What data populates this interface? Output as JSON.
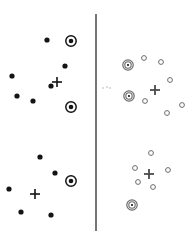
{
  "figure": {
    "title": "",
    "background_color": "#ffffff",
    "width": 192,
    "height": 238,
    "divider": {
      "name": "vertical-divider",
      "x": 96,
      "y_top": 14,
      "y_bottom": 231,
      "color": "#3c3c3c"
    }
  },
  "legend": {
    "filled_dot_label": "",
    "open_circle_label": "",
    "bullseye_label": "",
    "cross_label": ""
  },
  "chart_data": {
    "type": "scatter",
    "title": "",
    "subtitle": "",
    "xlabel": "",
    "ylabel": "",
    "xlim": [
      0,
      192
    ],
    "ylim": [
      0,
      238
    ],
    "grid": false,
    "legend_position": "none",
    "axis_visible": false,
    "colors": {
      "filled": "#141414",
      "open": "#6b6b6b",
      "cross_dark": "#141414",
      "cross_light": "#4a4a4a",
      "divider": "#3c3c3c",
      "background": "#ffffff"
    },
    "marker_styles": {
      "filled_dot_radius": 2.6,
      "open_circle_radius": 2.4,
      "bullseye_inner_radius": 2.3,
      "bullseye_outer_radius": 5.2,
      "cross_arm": 5
    },
    "panels": [
      {
        "name": "top-left-panel",
        "marker_style": "filled",
        "quadrant": "top-left",
        "points": [
          {
            "x": 47,
            "y": 40,
            "type": "dot"
          },
          {
            "x": 71,
            "y": 41,
            "type": "bullseye"
          },
          {
            "x": 65,
            "y": 66,
            "type": "dot"
          },
          {
            "x": 12,
            "y": 76,
            "type": "dot"
          },
          {
            "x": 51,
            "y": 86,
            "type": "dot"
          },
          {
            "x": 17,
            "y": 96,
            "type": "dot"
          },
          {
            "x": 33,
            "y": 101,
            "type": "dot"
          },
          {
            "x": 71,
            "y": 107,
            "type": "bullseye"
          }
        ],
        "centroid": {
          "x": 57,
          "y": 82,
          "type": "cross"
        }
      },
      {
        "name": "top-right-panel",
        "marker_style": "open",
        "quadrant": "top-right",
        "points": [
          {
            "x": 144,
            "y": 58,
            "type": "open"
          },
          {
            "x": 161,
            "y": 62,
            "type": "open"
          },
          {
            "x": 128,
            "y": 65,
            "type": "bullseye-open"
          },
          {
            "x": 170,
            "y": 80,
            "type": "open"
          },
          {
            "x": 129,
            "y": 96,
            "type": "bullseye-open"
          },
          {
            "x": 145,
            "y": 101,
            "type": "open"
          },
          {
            "x": 182,
            "y": 105,
            "type": "open"
          },
          {
            "x": 167,
            "y": 113,
            "type": "open"
          }
        ],
        "centroid": {
          "x": 155,
          "y": 90,
          "type": "cross"
        }
      },
      {
        "name": "bottom-left-panel",
        "marker_style": "filled",
        "quadrant": "bottom-left",
        "points": [
          {
            "x": 40,
            "y": 157,
            "type": "dot"
          },
          {
            "x": 55,
            "y": 173,
            "type": "dot"
          },
          {
            "x": 71,
            "y": 181,
            "type": "bullseye"
          },
          {
            "x": 9,
            "y": 189,
            "type": "dot"
          },
          {
            "x": 21,
            "y": 212,
            "type": "dot"
          },
          {
            "x": 51,
            "y": 215,
            "type": "dot"
          }
        ],
        "centroid": {
          "x": 35,
          "y": 194,
          "type": "cross"
        }
      },
      {
        "name": "bottom-right-panel",
        "marker_style": "open",
        "quadrant": "bottom-right",
        "points": [
          {
            "x": 151,
            "y": 153,
            "type": "open"
          },
          {
            "x": 135,
            "y": 168,
            "type": "open"
          },
          {
            "x": 168,
            "y": 170,
            "type": "open"
          },
          {
            "x": 138,
            "y": 182,
            "type": "open"
          },
          {
            "x": 153,
            "y": 187,
            "type": "open"
          },
          {
            "x": 132,
            "y": 205,
            "type": "bullseye-open"
          }
        ],
        "centroid": {
          "x": 149,
          "y": 174,
          "type": "cross"
        }
      }
    ],
    "specks": [
      {
        "x": 103,
        "y": 88
      },
      {
        "x": 107,
        "y": 87
      },
      {
        "x": 110,
        "y": 88
      }
    ]
  }
}
